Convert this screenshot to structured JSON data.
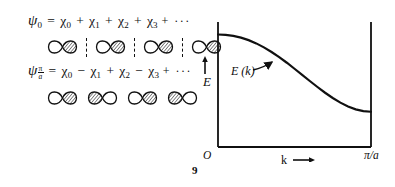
{
  "figure": {
    "type": "physics-figure",
    "page_number": "9"
  },
  "equations": [
    {
      "id": "psi-0",
      "lhs_symbol": "ψ",
      "lhs_subscript": "0",
      "equals": "=",
      "terms": [
        {
          "op": "",
          "symbol": "χ",
          "sub": "0"
        },
        {
          "op": "+",
          "symbol": "χ",
          "sub": "1"
        },
        {
          "op": "+",
          "symbol": "χ",
          "sub": "2"
        },
        {
          "op": "+",
          "symbol": "χ",
          "sub": "3"
        }
      ],
      "trailing": "+ ···"
    },
    {
      "id": "psi-pi-over-a",
      "lhs_symbol": "ψ",
      "lhs_subscript_numerator": "π",
      "lhs_subscript_denominator": "a",
      "equals": "=",
      "terms": [
        {
          "op": "",
          "symbol": "χ",
          "sub": "0"
        },
        {
          "op": "−",
          "symbol": "χ",
          "sub": "1"
        },
        {
          "op": "+",
          "symbol": "χ",
          "sub": "2"
        },
        {
          "op": "−",
          "symbol": "χ",
          "sub": "3"
        }
      ],
      "trailing": "+ ···"
    }
  ],
  "orbital_rows": [
    {
      "id": "orbital-row-bonding",
      "for_equation": "psi-0",
      "separators": "dashed-node-lines",
      "orbitals": [
        {
          "left_lobe": "white",
          "right_lobe": "hatched"
        },
        {
          "left_lobe": "white",
          "right_lobe": "hatched"
        },
        {
          "left_lobe": "white",
          "right_lobe": "hatched"
        },
        {
          "left_lobe": "white",
          "right_lobe": "hatched"
        }
      ]
    },
    {
      "id": "orbital-row-antibonding",
      "for_equation": "psi-pi-over-a",
      "separators": "none",
      "orbitals": [
        {
          "left_lobe": "white",
          "right_lobe": "hatched"
        },
        {
          "left_lobe": "hatched",
          "right_lobe": "white"
        },
        {
          "left_lobe": "white",
          "right_lobe": "hatched"
        },
        {
          "left_lobe": "hatched",
          "right_lobe": "white"
        }
      ]
    }
  ],
  "chart_data": {
    "type": "line",
    "title": "",
    "xlabel": "k",
    "ylabel": "E",
    "x_arrow": "→",
    "y_arrow": "↑",
    "xticklabels": [
      "O",
      "π/a"
    ],
    "yticklabels": [],
    "xlim": [
      0,
      1
    ],
    "ylim": [
      0,
      1
    ],
    "grid": false,
    "legend": false,
    "annotations": [
      {
        "text": "E (k)",
        "x": 0.28,
        "y": 0.52,
        "points_to_x": 0.46,
        "points_to_y": 0.62,
        "leader": "curved-arrow"
      }
    ],
    "series": [
      {
        "name": "E(k)",
        "comment": "tight-binding cosine band, monotonically decreasing",
        "x": [
          0.0,
          0.05,
          0.1,
          0.15,
          0.2,
          0.25,
          0.3,
          0.35,
          0.4,
          0.45,
          0.5,
          0.55,
          0.6,
          0.65,
          0.7,
          0.75,
          0.8,
          0.85,
          0.9,
          0.95,
          1.0
        ],
        "y": [
          0.9,
          0.897,
          0.889,
          0.875,
          0.855,
          0.829,
          0.797,
          0.76,
          0.719,
          0.674,
          0.626,
          0.577,
          0.528,
          0.48,
          0.434,
          0.392,
          0.355,
          0.324,
          0.301,
          0.287,
          0.282
        ]
      }
    ]
  },
  "page": {
    "number": "9"
  }
}
